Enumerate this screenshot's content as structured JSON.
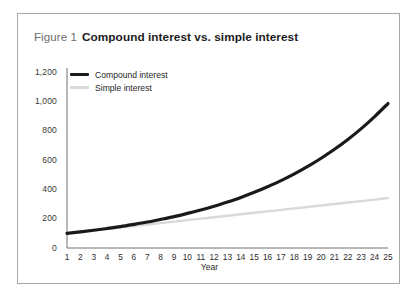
{
  "figure": {
    "number": "Figure 1",
    "title": "Compound interest vs. simple interest"
  },
  "colors": {
    "compound_line": "#1a1a1a",
    "simple_line": "#d9d9d9",
    "axis": "#707070",
    "border": "#a8a8a8",
    "tick_text": "#2b2b2b",
    "caption_number": "#6d6d6d",
    "caption_title": "#1b1b1b",
    "background": "#ffffff"
  },
  "chart_data": {
    "type": "line",
    "title": "Compound interest vs. simple interest",
    "xlabel": "Year",
    "ylabel": "",
    "xlim": [
      1,
      25
    ],
    "ylim": [
      0,
      1200
    ],
    "grid": false,
    "legend_position": "top-left",
    "x": [
      1,
      2,
      3,
      4,
      5,
      6,
      7,
      8,
      9,
      10,
      11,
      12,
      13,
      14,
      15,
      16,
      17,
      18,
      19,
      20,
      21,
      22,
      23,
      24,
      25
    ],
    "xtick_labels": [
      "1",
      "2",
      "3",
      "4",
      "5",
      "6",
      "7",
      "8",
      "9",
      "10",
      "11",
      "12",
      "13",
      "14",
      "15",
      "16",
      "17",
      "18",
      "19",
      "20",
      "21",
      "22",
      "23",
      "24",
      "25"
    ],
    "ytick_values": [
      0,
      200,
      400,
      600,
      800,
      1000,
      1200
    ],
    "ytick_labels": [
      "0",
      "200",
      "400",
      "600",
      "800",
      "1,000",
      "1,200"
    ],
    "series": [
      {
        "name": "Compound interest",
        "color": "#1a1a1a",
        "width": 3.2,
        "values": [
          100,
          110,
          121,
          133,
          146,
          161,
          177,
          195,
          214,
          236,
          259,
          285,
          314,
          345,
          380,
          418,
          459,
          505,
          556,
          612,
          673,
          740,
          814,
          896,
          985
        ]
      },
      {
        "name": "Simple interest",
        "color": "#d9d9d9",
        "width": 2.4,
        "values": [
          100,
          110,
          120,
          130,
          140,
          150,
          160,
          170,
          180,
          190,
          200,
          210,
          220,
          230,
          240,
          250,
          260,
          270,
          280,
          290,
          300,
          310,
          320,
          330,
          340
        ]
      }
    ]
  },
  "legend": [
    {
      "label": "Compound interest"
    },
    {
      "label": "Simple interest"
    }
  ]
}
